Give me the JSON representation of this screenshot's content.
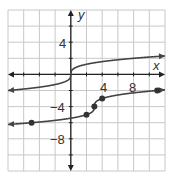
{
  "chart_data": {
    "type": "line",
    "title": "",
    "xlabel": "x",
    "ylabel": "y",
    "xlim": [
      -8,
      12
    ],
    "ylim": [
      -12,
      8
    ],
    "grid": true,
    "grid_step": 2,
    "x_tick_labels": [
      "4",
      "8"
    ],
    "y_tick_labels": [
      "4",
      "−4",
      "−8"
    ],
    "series": [
      {
        "name": "parent",
        "function": "y = cbrt(x)",
        "x": [
          -8,
          -1,
          0,
          1,
          8,
          12
        ],
        "y": [
          -2,
          -1,
          0,
          1,
          2,
          2.29
        ],
        "markers": false,
        "arrows": "both"
      },
      {
        "name": "transformed",
        "function": "y = cbrt(x - 3) - 4",
        "points": [
          [
            -5,
            -6
          ],
          [
            2,
            -5
          ],
          [
            3,
            -4
          ],
          [
            4,
            -3
          ],
          [
            11,
            -2
          ]
        ],
        "markers": true,
        "arrows": "both"
      }
    ],
    "colors": {
      "curve": "#444444",
      "grid": "#c8c8c8",
      "axis": "#222222"
    }
  },
  "labels": {
    "x_axis": "x",
    "y_axis": "y",
    "tick_x_4": "4",
    "tick_x_8": "8",
    "tick_y_4": "4",
    "tick_y_neg4": "−4",
    "tick_y_neg8": "−8"
  }
}
